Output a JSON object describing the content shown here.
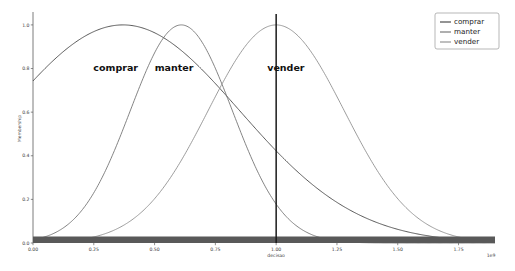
{
  "chart_data": {
    "type": "line",
    "title": "",
    "xlabel": "decisao",
    "ylabel": "Membership",
    "x_offset_text": "1e9",
    "xlim": [
      0.0,
      1.9
    ],
    "ylim": [
      0.0,
      1.05
    ],
    "xticks": [
      "0.00",
      "0.25",
      "0.50",
      "0.75",
      "1.00",
      "1.25",
      "1.50",
      "1.75"
    ],
    "xtick_values": [
      0.0,
      0.25,
      0.5,
      0.75,
      1.0,
      1.25,
      1.5,
      1.75
    ],
    "yticks": [
      "0.0",
      "0.2",
      "0.4",
      "0.6",
      "0.8",
      "1.0"
    ],
    "ytick_values": [
      0.0,
      0.2,
      0.4,
      0.6,
      0.8,
      1.0
    ],
    "grid": false,
    "legend_position": "upper right",
    "series": [
      {
        "name": "comprar",
        "color": "#3d3d3d",
        "peak_x": 0.37,
        "peak_y": 1.0,
        "sigma": 0.48,
        "skew": 0.0,
        "values_at_xticks": [
          0.79,
          0.92,
          0.99,
          0.96,
          0.85,
          0.69,
          0.51,
          0.35
        ]
      },
      {
        "name": "manter",
        "color": "#6e6e6e",
        "peak_x": 0.61,
        "peak_y": 1.0,
        "sigma": 0.21,
        "skew": 0.0,
        "values_at_xticks": [
          0.02,
          0.16,
          0.62,
          0.98,
          0.73,
          0.27,
          0.06,
          0.01
        ]
      },
      {
        "name": "vender",
        "color": "#8a8a8a",
        "peak_x": 1.0,
        "peak_y": 1.0,
        "sigma": 0.28,
        "skew": 0.0,
        "values_at_xticks": [
          0.0,
          0.01,
          0.08,
          0.34,
          1.0,
          0.63,
          0.19,
          0.04
        ]
      }
    ],
    "annotations": [
      {
        "text": "comprar",
        "x": 0.34,
        "y": 0.79
      },
      {
        "text": "manter",
        "x": 0.58,
        "y": 0.79
      },
      {
        "text": "vender",
        "x": 1.04,
        "y": 0.79
      }
    ],
    "vertical_marker": {
      "x": 1.0,
      "color": "#1a1a1a"
    },
    "baseline_band": {
      "y": 0.0,
      "color": "#595959",
      "label": ""
    }
  },
  "legend": {
    "items": [
      {
        "label": "comprar",
        "color": "#3d3d3d"
      },
      {
        "label": "manter",
        "color": "#6e6e6e"
      },
      {
        "label": "vender",
        "color": "#8a8a8a"
      }
    ]
  }
}
